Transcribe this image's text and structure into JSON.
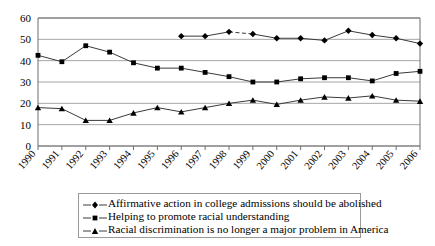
{
  "chart_data": {
    "type": "line",
    "title": "",
    "xlabel": "",
    "ylabel": "",
    "ylim": [
      0,
      60
    ],
    "ytick_step": 10,
    "grid": true,
    "legend_position": "bottom",
    "categories": [
      "1990",
      "1991",
      "1992",
      "1993",
      "1994",
      "1995",
      "1996",
      "1997",
      "1998",
      "1999",
      "2000",
      "2001",
      "2002",
      "2003",
      "2004",
      "2005",
      "2006"
    ],
    "yticks": [
      "0",
      "10",
      "20",
      "30",
      "40",
      "50",
      "60"
    ],
    "series": [
      {
        "name": "Affirmative action in college admissions should be abolished",
        "marker": "diamond",
        "values": [
          null,
          null,
          null,
          null,
          null,
          null,
          51.5,
          51.5,
          53.5,
          52.5,
          50.5,
          50.5,
          49.5,
          54.0,
          52.0,
          50.5,
          48.0
        ],
        "dashed_segments": [
          [
            2,
            3
          ]
        ]
      },
      {
        "name": "Helping to promote racial understanding",
        "marker": "square",
        "values": [
          42.5,
          39.5,
          47.0,
          44.0,
          39.0,
          36.5,
          36.5,
          34.5,
          32.5,
          30.0,
          30.0,
          31.5,
          32.0,
          32.0,
          30.5,
          34.0,
          35.0
        ]
      },
      {
        "name": "Racial discrimination is no longer a major problem in America",
        "marker": "triangle",
        "values": [
          18.0,
          17.5,
          12.0,
          12.0,
          15.5,
          18.0,
          16.0,
          18.0,
          20.0,
          21.5,
          19.5,
          21.5,
          23.0,
          22.5,
          23.5,
          21.5,
          21.0
        ]
      }
    ]
  },
  "legend": {
    "items": [
      {
        "label": "Affirmative action in college admissions should be abolished",
        "marker": "diamond"
      },
      {
        "label": "Helping to promote racial understanding",
        "marker": "square"
      },
      {
        "label": "Racial discrimination is no longer a major problem in America",
        "marker": "triangle"
      }
    ]
  },
  "colors": {
    "series_line": "#3a3a3a",
    "marker": "#000000",
    "gridline": "#a6a6a6",
    "axis": "#6e6e6e",
    "legend_border": "#9a9a9a",
    "text": "#000000",
    "background": "#ffffff"
  }
}
